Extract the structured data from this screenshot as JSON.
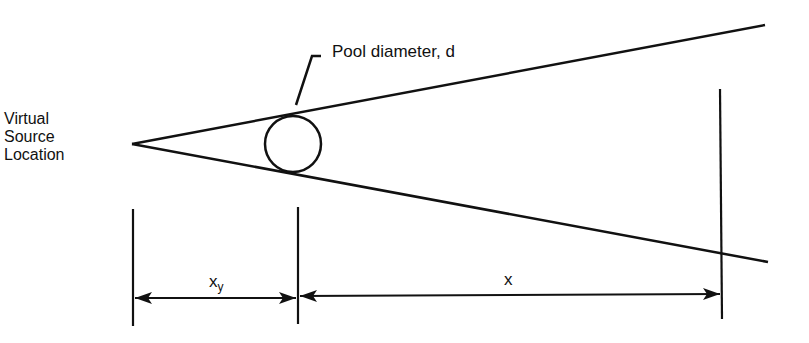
{
  "diagram": {
    "labels": {
      "virtual_source": [
        "Virtual",
        "Source",
        "Location"
      ],
      "pool_diameter": "Pool diameter, d",
      "xy_main": "x",
      "xy_sub": "y",
      "x": "x"
    },
    "colors": {
      "line": "#111111",
      "background": "#ffffff"
    }
  }
}
